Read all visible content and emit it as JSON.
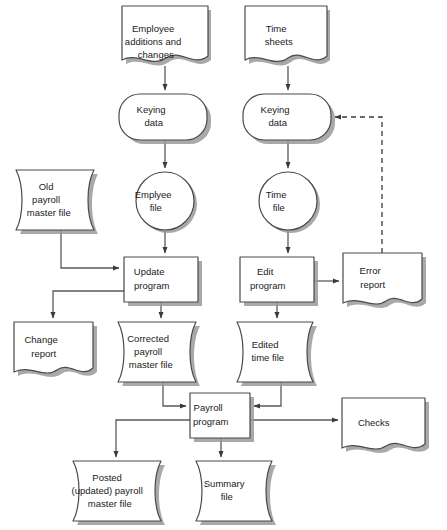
{
  "diagram": {
    "type": "flowchart",
    "canvas": {
      "width": 447,
      "height": 530
    },
    "background_color": "#ffffff",
    "line_color": "#5a5a5a",
    "shape_fill": "#ffffff",
    "shape_stroke": "#4a4a4a",
    "shadow_color": "#9a9a9a"
  },
  "nodes": {
    "employee_additions": {
      "label": "Employee\nadditions and\nchanges",
      "lines": [
        "Employee",
        "additions and",
        "changes"
      ],
      "shape": "document",
      "x": 122,
      "y": 6,
      "w": 86,
      "h": 57
    },
    "time_sheets": {
      "label": "Time\nsheets",
      "lines": [
        "Time",
        "sheets"
      ],
      "shape": "document",
      "x": 245,
      "y": 6,
      "w": 82,
      "h": 57
    },
    "keying_data_left": {
      "label": "Keying\ndata",
      "lines": [
        "Keying",
        "data"
      ],
      "shape": "terminator",
      "x": 119,
      "y": 94,
      "w": 88,
      "h": 46
    },
    "keying_data_right": {
      "label": "Keying\ndata",
      "lines": [
        "Keying",
        "data"
      ],
      "shape": "terminator",
      "x": 243,
      "y": 94,
      "w": 88,
      "h": 46
    },
    "old_payroll_master_file": {
      "label": "Old\npayroll\nmaster file",
      "lines": [
        "Old",
        "payroll",
        "master file"
      ],
      "shape": "magnetic-tape",
      "x": 16,
      "y": 170,
      "w": 90,
      "h": 60
    },
    "employee_file": {
      "label": "Emplyee\nfile",
      "lines": [
        "Emplyee",
        "file"
      ],
      "shape": "circle",
      "x": 136,
      "y": 172,
      "w": 58,
      "h": 58
    },
    "time_file": {
      "label": "Time\nfile",
      "lines": [
        "Time",
        "file"
      ],
      "shape": "circle",
      "x": 258,
      "y": 172,
      "w": 58,
      "h": 58
    },
    "update_program": {
      "label": "Update\nprogram",
      "lines": [
        "Update",
        "program"
      ],
      "shape": "process",
      "x": 124,
      "y": 257,
      "w": 74,
      "h": 45
    },
    "edit_program": {
      "label": "Edit\nprogram",
      "lines": [
        "Edit",
        "program"
      ],
      "shape": "process",
      "x": 240,
      "y": 257,
      "w": 74,
      "h": 45
    },
    "error_report": {
      "label": "Error\nreport",
      "lines": [
        "Error",
        "report"
      ],
      "shape": "document",
      "x": 343,
      "y": 253,
      "w": 79,
      "h": 55
    },
    "change_report": {
      "label": "Change\nreport",
      "lines": [
        "Change",
        "report"
      ],
      "shape": "document",
      "x": 14,
      "y": 322,
      "w": 79,
      "h": 55
    },
    "corrected_payroll_master_file": {
      "label": "Corrected\npayroll\nmaster file",
      "lines": [
        "Corrected",
        "payroll",
        "master file"
      ],
      "shape": "magnetic-tape",
      "x": 118,
      "y": 322,
      "w": 90,
      "h": 60
    },
    "edited_time_file": {
      "label": "Edited\ntime file",
      "lines": [
        "Edited",
        "time file"
      ],
      "shape": "magnetic-tape",
      "x": 237,
      "y": 322,
      "w": 88,
      "h": 60
    },
    "payroll_program": {
      "label": "Payroll\nprogram",
      "lines": [
        "Payroll",
        "program"
      ],
      "shape": "process",
      "x": 190,
      "y": 393,
      "w": 60,
      "h": 45
    },
    "checks": {
      "label": "Checks",
      "lines": [
        "Checks"
      ],
      "shape": "document",
      "x": 342,
      "y": 398,
      "w": 83,
      "h": 55
    },
    "posted_payroll_master_file": {
      "label": "Posted\n(updated) payroll\nmaster file",
      "lines": [
        "Posted",
        "(updated) payroll",
        "master file"
      ],
      "shape": "magnetic-tape",
      "x": 73,
      "y": 461,
      "w": 100,
      "h": 60
    },
    "summary_file": {
      "label": "Summary\nfile",
      "lines": [
        "Summary",
        "file"
      ],
      "shape": "magnetic-tape",
      "x": 196,
      "y": 461,
      "w": 88,
      "h": 60
    }
  },
  "edges": [
    {
      "name": "employee-additions-to-keying-left",
      "style": "solid"
    },
    {
      "name": "time-sheets-to-keying-right",
      "style": "solid"
    },
    {
      "name": "keying-left-to-employee-file",
      "style": "solid"
    },
    {
      "name": "keying-right-to-time-file",
      "style": "solid"
    },
    {
      "name": "employee-file-to-update-program",
      "style": "solid"
    },
    {
      "name": "time-file-to-edit-program",
      "style": "solid"
    },
    {
      "name": "old-payroll-master-to-update-program",
      "style": "solid"
    },
    {
      "name": "update-program-to-change-report",
      "style": "solid"
    },
    {
      "name": "update-program-to-corrected-payroll-master",
      "style": "solid"
    },
    {
      "name": "edit-program-to-error-report",
      "style": "solid"
    },
    {
      "name": "edit-program-to-edited-time-file",
      "style": "solid"
    },
    {
      "name": "error-report-to-keying-right-feedback",
      "style": "dashed"
    },
    {
      "name": "corrected-payroll-master-to-payroll-program",
      "style": "solid"
    },
    {
      "name": "edited-time-file-to-payroll-program",
      "style": "solid"
    },
    {
      "name": "payroll-program-to-checks",
      "style": "solid"
    },
    {
      "name": "payroll-program-to-posted-payroll-master",
      "style": "solid"
    },
    {
      "name": "payroll-program-to-summary-file",
      "style": "solid"
    }
  ]
}
